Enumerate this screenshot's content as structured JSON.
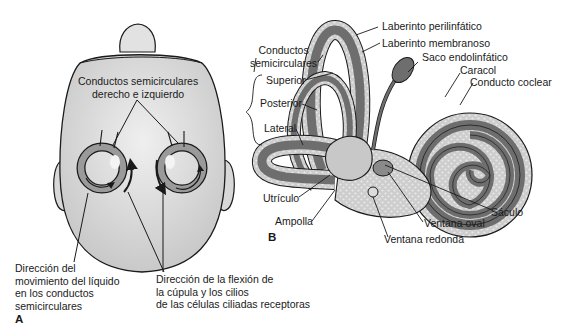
{
  "figure": {
    "panel_a": {
      "letter": "A",
      "labels": {
        "canals": "Conductos semicirculares\nderecho e izquierdo",
        "fluid_direction": "Dirección del\nmovimiento del líquido\nen los conductos\nsemicirculares",
        "cupula_direction": "Dirección de la flexión de\nla cúpula y los cilios\nde las células ciliadas receptoras"
      }
    },
    "panel_b": {
      "letter": "B",
      "labels": {
        "perilymphatic": "Laberinto perilinfático",
        "membranous": "Laberinto membranoso",
        "canals_group": "Conductos\nsemicirculares",
        "superior": "Superior",
        "posterior": "Posterior",
        "lateral": "Lateral",
        "endolymphatic_sac": "Saco endolinfático",
        "cochlea": "Caracol",
        "cochlear_duct": "Conducto coclear",
        "utricle": "Utrículo",
        "ampulla": "Ampolla",
        "saccule": "Sáculo",
        "oval_window": "Ventana oval",
        "round_window": "Ventana redonda"
      }
    },
    "colors": {
      "outline": "#1a1a1a",
      "head_fill": "#dcdcdc",
      "membranous": "#6e6e6e",
      "perilymph": "#cfcfcf",
      "inner_light": "#bdbdbd"
    }
  }
}
